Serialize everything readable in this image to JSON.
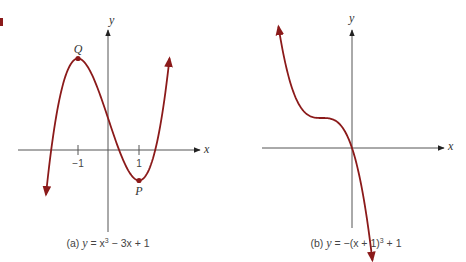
{
  "figure": {
    "corner_mark_color": "#8b1a1a",
    "curve_color": "#8b1a1a",
    "axis_color": "#555555",
    "panels": [
      {
        "id": "a",
        "caption_prefix": "(a) ",
        "caption_var": "y",
        "caption_eq": " = x",
        "caption_exp": "3",
        "caption_rest": " − 3x + 1",
        "x_axis_label": "x",
        "y_axis_label": "y",
        "tick_labels": [
          "−1",
          "1"
        ],
        "points": [
          {
            "label": "Q",
            "x": -1,
            "y": 3
          },
          {
            "label": "P",
            "x": 1,
            "y": -1
          }
        ]
      },
      {
        "id": "b",
        "caption_prefix": "(b) ",
        "caption_var": "y",
        "caption_eq": " = −(x + 1)",
        "caption_exp": "3",
        "caption_rest": " + 1",
        "x_axis_label": "x",
        "y_axis_label": "y"
      }
    ]
  },
  "chart_data": [
    {
      "type": "line",
      "title": "(a) y = x³ − 3x + 1",
      "xlabel": "x",
      "ylabel": "y",
      "x_ticks": [
        -1,
        1
      ],
      "function": "x^3 - 3x + 1",
      "x": [
        -2.05,
        -1.5,
        -1,
        -0.5,
        0,
        0.5,
        1,
        1.5,
        2.0
      ],
      "values": [
        -2.46,
        2.125,
        3,
        2.375,
        1,
        -0.375,
        -1,
        -0.125,
        3
      ],
      "annotations": [
        {
          "label": "Q",
          "x": -1,
          "y": 3,
          "type": "local max"
        },
        {
          "label": "P",
          "x": 1,
          "y": -1,
          "type": "local min"
        }
      ],
      "grid": false
    },
    {
      "type": "line",
      "title": "(b) y = −(x + 1)³ + 1",
      "xlabel": "x",
      "ylabel": "y",
      "function": "-(x+1)^3 + 1",
      "x": [
        -2.45,
        -2,
        -1.5,
        -1,
        -0.5,
        0,
        0.5
      ],
      "values": [
        4.05,
        2,
        1.125,
        1,
        0.875,
        0,
        -2.375
      ],
      "annotations": [],
      "grid": false
    }
  ]
}
